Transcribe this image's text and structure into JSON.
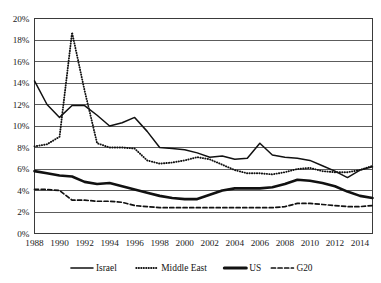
{
  "chart_data": {
    "type": "line",
    "title": "",
    "subtitle": "",
    "xlabel": "",
    "ylabel": "",
    "xlim": [
      1988,
      2015
    ],
    "ylim": [
      0,
      0.2
    ],
    "y_tick_format": "percent",
    "grid": "horizontal",
    "legend_position": "bottom",
    "y_ticks": [
      "0%",
      "2%",
      "4%",
      "6%",
      "8%",
      "10%",
      "12%",
      "14%",
      "16%",
      "18%",
      "20%"
    ],
    "y_tick_values": [
      0,
      2,
      4,
      6,
      8,
      10,
      12,
      14,
      16,
      18,
      20
    ],
    "x_ticks": [
      "1988",
      "1990",
      "1992",
      "1994",
      "1996",
      "1998",
      "2000",
      "2002",
      "2004",
      "2006",
      "2008",
      "2010",
      "2012",
      "2014"
    ],
    "x_tick_values": [
      1988,
      1990,
      1992,
      1994,
      1996,
      1998,
      2000,
      2002,
      2004,
      2006,
      2008,
      2010,
      2012,
      2014
    ],
    "x": [
      1988,
      1989,
      1990,
      1991,
      1992,
      1993,
      1994,
      1995,
      1996,
      1997,
      1998,
      1999,
      2000,
      2001,
      2002,
      2003,
      2004,
      2005,
      2006,
      2007,
      2008,
      2009,
      2010,
      2011,
      2012,
      2013,
      2014,
      2015
    ],
    "series": [
      {
        "name": "Israel",
        "style": "solid",
        "stroke_width": 1.5,
        "values": [
          14.2,
          12.0,
          10.8,
          11.9,
          11.9,
          11.0,
          10.0,
          10.3,
          10.8,
          9.5,
          8.0,
          7.9,
          7.8,
          7.5,
          7.1,
          7.2,
          6.9,
          7.0,
          8.4,
          7.3,
          7.1,
          7.0,
          6.8,
          6.3,
          5.8,
          5.2,
          5.9,
          6.2
        ]
      },
      {
        "name": "Middle East",
        "style": "dotted",
        "stroke_width": 1.9,
        "values": [
          8.1,
          8.3,
          9.0,
          18.7,
          13.3,
          8.4,
          8.0,
          8.0,
          7.9,
          6.8,
          6.5,
          6.6,
          6.8,
          7.1,
          6.9,
          6.4,
          5.9,
          5.6,
          5.6,
          5.5,
          5.7,
          6.0,
          6.1,
          5.8,
          5.7,
          5.7,
          5.9,
          6.3
        ]
      },
      {
        "name": "US",
        "style": "solid",
        "stroke_width": 2.6,
        "values": [
          5.8,
          5.6,
          5.4,
          5.3,
          4.8,
          4.6,
          4.7,
          4.4,
          4.1,
          3.8,
          3.5,
          3.3,
          3.2,
          3.2,
          3.6,
          4.0,
          4.2,
          4.2,
          4.2,
          4.3,
          4.6,
          5.0,
          4.9,
          4.7,
          4.4,
          3.9,
          3.5,
          3.3
        ]
      },
      {
        "name": "G20",
        "style": "dashed",
        "stroke_width": 1.7,
        "values": [
          4.1,
          4.1,
          4.0,
          3.1,
          3.1,
          3.0,
          3.0,
          2.9,
          2.6,
          2.5,
          2.4,
          2.4,
          2.4,
          2.4,
          2.4,
          2.4,
          2.4,
          2.4,
          2.4,
          2.4,
          2.5,
          2.8,
          2.8,
          2.7,
          2.6,
          2.5,
          2.5,
          2.6
        ]
      }
    ],
    "legend": [
      {
        "label": "Israel",
        "style": "solid"
      },
      {
        "label": "Middle East",
        "style": "dotted"
      },
      {
        "label": "US",
        "style": "thick-solid"
      },
      {
        "label": "G20",
        "style": "dashed"
      }
    ],
    "colors": {
      "series": "#111111",
      "grid": "#4a4a4a",
      "border": "#3a3a3a",
      "text": "#1a1a1a",
      "background": "#ffffff"
    }
  }
}
